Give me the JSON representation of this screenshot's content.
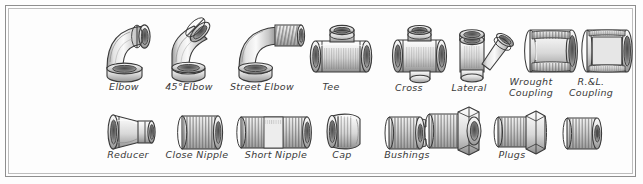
{
  "plate": {
    "title": "Pipe Fittings",
    "frame_color": "#8e8e8e",
    "frame_inner_color": "#bdbdbd",
    "background": "#fdfdfd",
    "ink_color": "#3a3a3a",
    "metal_light": "#f2f2f2",
    "metal_mid": "#cfcfcf",
    "metal_dark": "#9a9a9a",
    "metal_shadow": "#6e6e6e"
  },
  "rows": [
    {
      "name": "top-row",
      "items": [
        {
          "id": "elbow",
          "label": "Elbow",
          "label_lines": [
            "Elbow"
          ]
        },
        {
          "id": "forty-five-elbow",
          "label": "45°Elbow",
          "label_lines": [
            "45°Elbow"
          ]
        },
        {
          "id": "street-elbow",
          "label": "Street Elbow",
          "label_lines": [
            "Street Elbow"
          ]
        },
        {
          "id": "tee",
          "label": "Tee",
          "label_lines": [
            "Tee"
          ]
        },
        {
          "id": "cross",
          "label": "Cross",
          "label_lines": [
            "Cross"
          ]
        },
        {
          "id": "lateral",
          "label": "Lateral",
          "label_lines": [
            "Lateral"
          ]
        },
        {
          "id": "wrought-coupling",
          "label": "Wrought Coupling",
          "label_lines": [
            "Wrought",
            "Coupling"
          ]
        },
        {
          "id": "rl-coupling",
          "label": "R.&L. Coupling",
          "label_lines": [
            "R.&L.",
            "Coupling"
          ]
        }
      ]
    },
    {
      "name": "bottom-row",
      "items": [
        {
          "id": "reducer",
          "label": "Reducer",
          "label_lines": [
            "Reducer"
          ]
        },
        {
          "id": "close-nipple",
          "label": "Close Nipple",
          "label_lines": [
            "Close Nipple"
          ]
        },
        {
          "id": "short-nipple",
          "label": "Short Nipple",
          "label_lines": [
            "Short Nipple"
          ]
        },
        {
          "id": "cap",
          "label": "Cap",
          "label_lines": [
            "Cap"
          ]
        },
        {
          "id": "bushing-one",
          "label": "Bushings",
          "label_lines": [
            "Bushings"
          ]
        },
        {
          "id": "bushing-two",
          "label": "",
          "label_lines": []
        },
        {
          "id": "plug-one",
          "label": "Plugs",
          "label_lines": [
            "Plugs"
          ]
        },
        {
          "id": "plug-two",
          "label": "",
          "label_lines": []
        }
      ]
    }
  ],
  "labels": {
    "elbow": "Elbow",
    "forty_five_elbow": "45°Elbow",
    "street_elbow": "Street Elbow",
    "tee": "Tee",
    "cross": "Cross",
    "lateral": "Lateral",
    "wrought_coupling_l1": "Wrought",
    "wrought_coupling_l2": "Coupling",
    "rl_coupling_l1": "R.&L.",
    "rl_coupling_l2": "Coupling",
    "reducer": "Reducer",
    "close_nipple": "Close Nipple",
    "short_nipple": "Short Nipple",
    "cap": "Cap",
    "bushings": "Bushings",
    "plugs": "Plugs"
  }
}
